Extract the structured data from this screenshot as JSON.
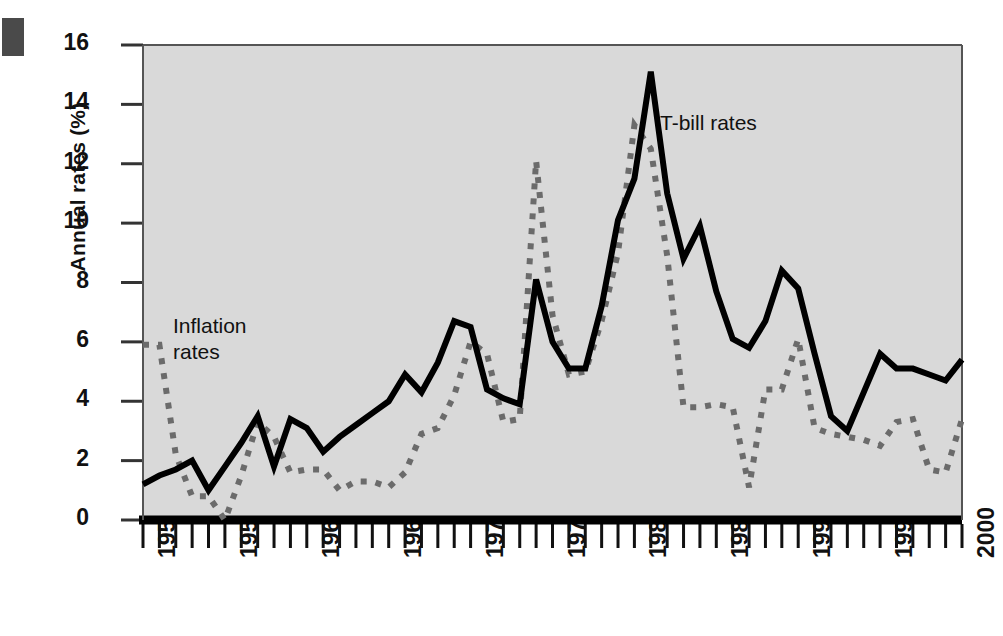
{
  "chart_data": {
    "type": "line",
    "title": "",
    "xlabel": "",
    "ylabel": "Annual rates (%)",
    "xlim": [
      1950,
      2000
    ],
    "ylim": [
      0,
      16
    ],
    "ytick_values": [
      0,
      2,
      4,
      6,
      8,
      10,
      12,
      14,
      16
    ],
    "ytick_labels": [
      "0",
      "2",
      "4",
      "6",
      "8",
      "10",
      "12",
      "14",
      "16"
    ],
    "xtick_values": [
      1950,
      1955,
      1960,
      1965,
      1970,
      1975,
      1980,
      1985,
      1990,
      1995,
      2000
    ],
    "xtick_labels": [
      "1950",
      "1955",
      "1960",
      "1965",
      "1970",
      "1975",
      "1980",
      "1985",
      "1990",
      "1995",
      "2000"
    ],
    "minor_xticks": "every year",
    "grid": false,
    "legend_position": "inline-annotations",
    "plot_background": "#d9d9d9",
    "x": [
      1950,
      1951,
      1952,
      1953,
      1954,
      1955,
      1956,
      1957,
      1958,
      1959,
      1960,
      1961,
      1962,
      1963,
      1964,
      1965,
      1966,
      1967,
      1968,
      1969,
      1970,
      1971,
      1972,
      1973,
      1974,
      1975,
      1976,
      1977,
      1978,
      1979,
      1980,
      1981,
      1982,
      1983,
      1984,
      1985,
      1986,
      1987,
      1988,
      1989,
      1990,
      1991,
      1992,
      1993,
      1994,
      1995,
      1996,
      1997,
      1998,
      1999,
      2000
    ],
    "series": [
      {
        "name": "T-bill rates",
        "style": "solid",
        "color": "#000000",
        "annotation": "T-bill rates",
        "values": [
          1.2,
          1.5,
          1.7,
          2.0,
          1.0,
          1.8,
          2.6,
          3.5,
          1.8,
          3.4,
          3.1,
          2.3,
          2.8,
          3.2,
          3.6,
          4.0,
          4.9,
          4.3,
          5.3,
          6.7,
          6.5,
          4.4,
          4.1,
          3.9,
          8.1,
          6.0,
          5.1,
          5.1,
          7.2,
          10.1,
          11.5,
          15.1,
          11.0,
          8.8,
          9.9,
          7.7,
          6.1,
          5.8,
          6.7,
          8.4,
          7.8,
          5.6,
          3.5,
          3.0,
          4.3,
          5.6,
          5.1,
          5.1,
          4.9,
          4.7,
          5.4
        ]
      },
      {
        "name": "Inflation rates",
        "style": "dashed",
        "color": "#6b6b6b",
        "annotation": "Inflation rates",
        "values": [
          5.9,
          5.9,
          2.2,
          0.8,
          0.8,
          0.0,
          1.5,
          3.3,
          2.8,
          1.6,
          1.7,
          1.7,
          1.0,
          1.3,
          1.3,
          1.1,
          1.6,
          2.9,
          3.1,
          4.2,
          6.0,
          5.6,
          3.3,
          3.4,
          12.1,
          6.9,
          4.9,
          5.0,
          6.7,
          9.0,
          13.3,
          12.5,
          8.9,
          3.8,
          3.8,
          3.9,
          3.8,
          1.1,
          4.4,
          4.4,
          6.1,
          3.1,
          2.9,
          2.8,
          2.7,
          2.5,
          3.3,
          3.4,
          1.7,
          1.6,
          3.4
        ]
      }
    ]
  }
}
